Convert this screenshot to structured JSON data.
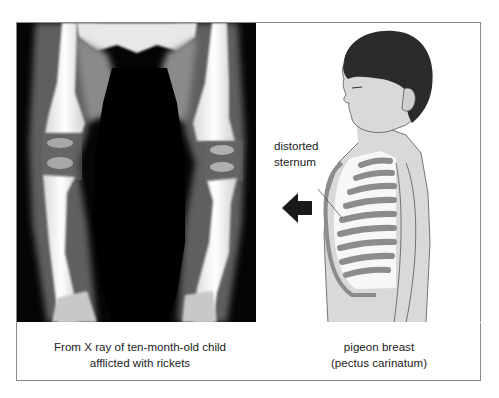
{
  "figure": {
    "panels": [
      {
        "id": "xray",
        "image": "x-ray of child's legs showing bowed femurs and tibias with widened growth plates",
        "caption_lines": [
          "From X ray of ten-month-old child",
          "afflicted with rickets"
        ]
      },
      {
        "id": "pigeon-breast",
        "image": "side-view illustration of boy with protruding chest and rib cage",
        "annotation": {
          "lines": [
            "distorted",
            "sternum"
          ],
          "arrow": "left-pointing arrow indicating outward protrusion of sternum"
        },
        "caption_lines": [
          "pigeon breast",
          "(pectus carinatum)"
        ]
      }
    ],
    "colors": {
      "frame_border": "#8a8a8a",
      "text": "#222222",
      "skin": "#d9d9d9",
      "hair": "#2b2b2b",
      "ribs": "#8c8c8c",
      "arrow": "#1a1a1a"
    }
  }
}
